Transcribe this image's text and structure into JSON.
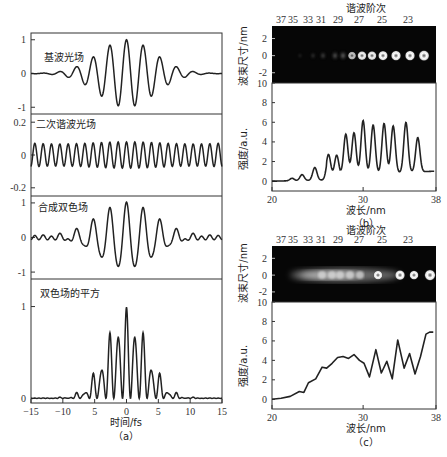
{
  "chart_data": [
    {
      "type": "line",
      "panel": "a",
      "caption": "（a）",
      "xlabel": "时间/fs",
      "xlim": [
        -15,
        15
      ],
      "xticks": [
        "-15",
        "-10",
        "5",
        "0",
        "5",
        "10",
        "15"
      ],
      "subplots": [
        {
          "title": "基波光场",
          "ylim": [
            -1.2,
            1.2
          ],
          "yticks": [
            "1",
            "0",
            "-1"
          ],
          "series": [
            {
              "name": "fundamental field",
              "formula": "exp(-(t/6.2)^2)*cos(2.4*t)"
            }
          ]
        },
        {
          "title": "二次谐波光场",
          "ylim": [
            -0.25,
            0.25
          ],
          "yticks": [
            "0.2",
            "0",
            "-0.2"
          ],
          "series": [
            {
              "name": "second harmonic field",
              "formula": "0.08*cos(4.8*t)"
            }
          ]
        },
        {
          "title": "合成双色场",
          "ylim": [
            -1.2,
            1.2
          ],
          "yticks": [
            "1",
            "0",
            "-1"
          ],
          "series": [
            {
              "name": "two-color field",
              "formula": "fundamental + SH"
            }
          ]
        },
        {
          "title": "双色场的平方",
          "ylim": [
            -0.05,
            1.3
          ],
          "yticks": [
            "1",
            "0"
          ],
          "series": [
            {
              "name": "square of two-color field",
              "peaks_x": [
                -8,
                -6.6,
                -5.3,
                -4,
                -2.6,
                -1.3,
                0,
                1.3,
                2.6,
                4,
                5.3,
                6.6,
                8
              ],
              "peaks_y": [
                0.13,
                0.1,
                0.44,
                0.39,
                0.94,
                0.75,
                1.2,
                0.75,
                0.94,
                0.39,
                0.44,
                0.1,
                0.13
              ]
            }
          ]
        }
      ]
    },
    {
      "type": "line",
      "panel": "b",
      "caption": "（b）",
      "image_title": "谐波阶次",
      "harmonic_orders": [
        "37",
        "35",
        "33",
        "31",
        "29",
        "27",
        "25",
        "23"
      ],
      "image_ylabel": "波束尺寸/nm",
      "image_yticks": [
        "2",
        "0",
        "-2"
      ],
      "xlabel": "波长/nm",
      "ylabel": "强度/a.u.",
      "xlim": [
        20,
        38
      ],
      "ylim": [
        -1,
        10
      ],
      "xticks": [
        "20",
        "30",
        "38"
      ],
      "yticks": [
        "10",
        "8",
        "6",
        "4",
        "2",
        "0"
      ],
      "peaks_x": [
        22.2,
        23.3,
        24.7,
        26.2,
        27.1,
        28.1,
        29.0,
        30.0,
        31.1,
        32.3,
        33.3,
        34.7,
        36.0
      ],
      "peaks_y": [
        0.25,
        0.6,
        1.3,
        2.3,
        2.2,
        4.2,
        4.3,
        5.5,
        5.0,
        5.1,
        4.8,
        5.1,
        3.5
      ]
    },
    {
      "type": "line",
      "panel": "c",
      "caption": "（c）",
      "image_title": "谐波阶次",
      "harmonic_orders": [
        "37",
        "35",
        "33",
        "31",
        "29",
        "27",
        "25",
        "23"
      ],
      "image_ylabel": "波束尺寸/nm",
      "image_yticks": [
        "2",
        "0",
        "-2"
      ],
      "xlabel": "波长/nm",
      "ylabel": "强度/a.u.",
      "xlim": [
        20,
        38
      ],
      "ylim": [
        -1,
        10
      ],
      "xticks": [
        "20",
        "30",
        "38"
      ],
      "yticks": [
        "10",
        "8",
        "6",
        "4",
        "2",
        "0"
      ],
      "x": [
        20,
        21,
        22,
        23,
        23.5,
        24,
        24.8,
        25.5,
        26,
        26.6,
        27.2,
        27.8,
        28.4,
        29,
        29.6,
        30.1,
        30.7,
        31.4,
        32,
        32.6,
        33.2,
        33.8,
        34.5,
        35.1,
        35.7,
        36.3,
        36.9,
        37.3,
        37.7
      ],
      "y": [
        0,
        0.1,
        0.3,
        0.8,
        0.7,
        1.7,
        2.1,
        3.3,
        3.2,
        3.7,
        4.3,
        4.4,
        4.2,
        4.6,
        4.0,
        3.7,
        2.3,
        5.1,
        2.7,
        3.9,
        2.1,
        6.1,
        3.2,
        4.7,
        2.6,
        4.4,
        6.7,
        6.9,
        6.9
      ]
    }
  ],
  "labels": {
    "a": {
      "panel_titles": [
        "基波光场",
        "二次谐波光场",
        "合成双色场",
        "双色场的平方"
      ],
      "xlabel": "时间/fs",
      "caption": "（a）",
      "xticks": [
        "-15",
        "-10",
        "5",
        "0",
        "5",
        "10",
        "15"
      ]
    },
    "b": {
      "image_title": "谐波阶次",
      "image_ylabel": "波束尺寸/nm",
      "ylabel": "强度/a.u.",
      "xlabel": "波长/nm",
      "caption": "（b）"
    },
    "c": {
      "image_title": "谐波阶次",
      "image_ylabel": "波束尺寸/nm",
      "ylabel": "强度/a.u.",
      "xlabel": "波长/nm",
      "caption": "（c）"
    }
  }
}
